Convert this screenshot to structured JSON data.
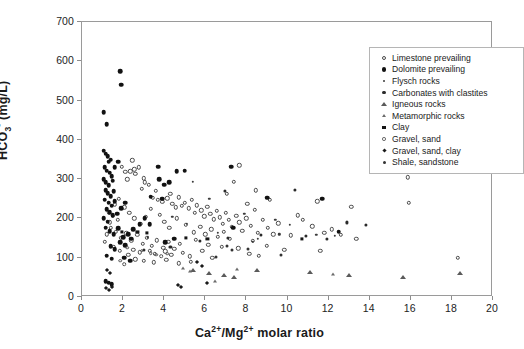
{
  "chart_data": {
    "type": "scatter",
    "title": "",
    "xlabel": "Ca2+/Mg2+ molar ratio",
    "ylabel": "HCO3- (mg/L)",
    "xlim": [
      0,
      20
    ],
    "ylim": [
      0,
      700
    ],
    "xticks": [
      "0",
      "2",
      "4",
      "6",
      "8",
      "10",
      "12",
      "14",
      "16",
      "18",
      "20"
    ],
    "yticks": [
      "0",
      "100",
      "200",
      "300",
      "400",
      "500",
      "600",
      "700"
    ],
    "grid": false,
    "legend_position": "top-right",
    "series": [
      {
        "name": "Limestone prevailing",
        "marker": "open-circle",
        "color": "#4a4a4a",
        "points": [
          [
            1.95,
            332
          ],
          [
            2.1,
            318
          ],
          [
            2.35,
            320
          ],
          [
            2.55,
            325
          ],
          [
            2.6,
            313
          ],
          [
            2.75,
            330
          ],
          [
            3.0,
            302
          ],
          [
            3.05,
            292
          ],
          [
            2.9,
            276
          ],
          [
            3.25,
            285
          ],
          [
            3.45,
            253
          ],
          [
            3.7,
            247
          ],
          [
            3.6,
            270
          ],
          [
            3.9,
            243
          ],
          [
            4.15,
            251
          ],
          [
            4.3,
            262
          ],
          [
            4.4,
            238
          ],
          [
            4.55,
            228
          ],
          [
            4.7,
            254
          ],
          [
            4.85,
            232
          ],
          [
            5.0,
            240
          ],
          [
            5.2,
            226
          ],
          [
            5.35,
            248
          ],
          [
            5.5,
            215
          ],
          [
            5.6,
            233
          ],
          [
            5.8,
            221
          ],
          [
            5.95,
            205
          ],
          [
            6.1,
            229
          ],
          [
            6.25,
            211
          ],
          [
            6.4,
            198
          ],
          [
            6.55,
            219
          ],
          [
            6.7,
            203
          ],
          [
            6.85,
            186
          ],
          [
            7.0,
            214
          ],
          [
            7.15,
            196
          ],
          [
            7.3,
            178
          ],
          [
            7.5,
            206
          ],
          [
            7.65,
            190
          ],
          [
            7.8,
            168
          ],
          [
            8.0,
            200
          ],
          [
            8.2,
            182
          ],
          [
            8.4,
            222
          ],
          [
            8.55,
            164
          ],
          [
            8.8,
            196
          ],
          [
            9.05,
            176
          ],
          [
            9.3,
            160
          ],
          [
            9.55,
            188
          ],
          [
            7.05,
            262
          ],
          [
            7.4,
            293
          ],
          [
            8.05,
            238
          ],
          [
            2.45,
            348
          ],
          [
            2.2,
            300
          ],
          [
            3.35,
            224
          ],
          [
            3.8,
            210
          ],
          [
            4.0,
            192
          ],
          [
            4.25,
            176
          ],
          [
            4.6,
            200
          ],
          [
            5.05,
            183
          ],
          [
            5.45,
            165
          ],
          [
            5.75,
            178
          ],
          [
            6.0,
            160
          ],
          [
            6.3,
            172
          ],
          [
            6.6,
            154
          ],
          [
            6.9,
            166
          ],
          [
            7.2,
            148
          ],
          [
            1.4,
            176
          ],
          [
            1.65,
            166
          ],
          [
            1.9,
            150
          ],
          [
            2.15,
            162
          ],
          [
            2.4,
            144
          ],
          [
            2.7,
            158
          ],
          [
            2.95,
            136
          ],
          [
            3.15,
            150
          ],
          [
            3.4,
            130
          ],
          [
            3.65,
            144
          ],
          [
            3.95,
            126
          ],
          [
            4.2,
            140
          ],
          [
            4.5,
            122
          ],
          [
            4.75,
            136
          ],
          [
            2.05,
            228
          ],
          [
            2.3,
            214
          ],
          [
            2.55,
            200
          ],
          [
            2.85,
            186
          ],
          [
            3.1,
            204
          ],
          [
            2.5,
            120
          ],
          [
            2.8,
            114
          ],
          [
            3.3,
            118
          ],
          [
            3.55,
            110
          ],
          [
            4.05,
            116
          ],
          [
            4.35,
            108
          ],
          [
            4.9,
            112
          ],
          [
            5.25,
            104
          ],
          [
            1.75,
            196
          ],
          [
            1.5,
            206
          ],
          [
            1.3,
            216
          ],
          [
            3.0,
            92
          ],
          [
            3.5,
            88
          ],
          [
            4.1,
            94
          ],
          [
            4.7,
            86
          ],
          [
            5.3,
            90
          ],
          [
            5.55,
            146
          ],
          [
            6.15,
            133
          ],
          [
            6.8,
            128
          ],
          [
            7.6,
            124
          ],
          [
            8.3,
            143
          ],
          [
            9.0,
            130
          ],
          [
            10.5,
            208
          ],
          [
            10.75,
            197
          ],
          [
            11.2,
            180
          ],
          [
            11.45,
            244
          ],
          [
            11.8,
            164
          ],
          [
            12.15,
            172
          ],
          [
            12.6,
            158
          ],
          [
            13.1,
            230
          ],
          [
            13.35,
            148
          ],
          [
            15.85,
            305
          ],
          [
            15.9,
            240
          ],
          [
            7.65,
            335
          ],
          [
            8.45,
            272
          ],
          [
            9.15,
            248
          ],
          [
            8.15,
            110
          ],
          [
            8.6,
            105
          ],
          [
            18.3,
            100
          ],
          [
            5.85,
            118
          ],
          [
            6.35,
            100
          ],
          [
            1.2,
            160
          ],
          [
            1.1,
            140
          ],
          [
            1.55,
            128
          ],
          [
            1.85,
            118
          ],
          [
            2.25,
            108
          ],
          [
            2.6,
            96
          ],
          [
            1.35,
            190
          ],
          [
            1.6,
            236
          ],
          [
            1.8,
            250
          ],
          [
            10.15,
            157
          ],
          [
            11.6,
            118
          ],
          [
            9.85,
            120
          ]
        ]
      },
      {
        "name": "Dolomite prevailing",
        "marker": "filled-circle",
        "color": "#121212",
        "points": [
          [
            1.05,
            470
          ],
          [
            1.2,
            440
          ],
          [
            1.85,
            575
          ],
          [
            1.9,
            540
          ],
          [
            1.05,
            372
          ],
          [
            1.15,
            365
          ],
          [
            1.25,
            358
          ],
          [
            1.3,
            344
          ],
          [
            1.4,
            350
          ],
          [
            1.1,
            330
          ],
          [
            1.2,
            322
          ],
          [
            1.35,
            316
          ],
          [
            1.45,
            308
          ],
          [
            1.05,
            300
          ],
          [
            1.15,
            292
          ],
          [
            1.3,
            285
          ],
          [
            1.5,
            296
          ],
          [
            1.6,
            330
          ],
          [
            1.75,
            344
          ],
          [
            1.15,
            272
          ],
          [
            1.25,
            264
          ],
          [
            1.4,
            256
          ],
          [
            1.55,
            270
          ],
          [
            1.1,
            248
          ],
          [
            1.3,
            240
          ],
          [
            1.45,
            232
          ],
          [
            1.6,
            244
          ],
          [
            1.2,
            224
          ],
          [
            1.35,
            216
          ],
          [
            1.5,
            208
          ],
          [
            1.05,
            200
          ],
          [
            1.25,
            192
          ],
          [
            1.7,
            212
          ],
          [
            1.9,
            226
          ],
          [
            2.1,
            240
          ],
          [
            1.15,
            176
          ],
          [
            1.35,
            168
          ],
          [
            1.55,
            160
          ],
          [
            1.75,
            175
          ],
          [
            2.0,
            152
          ],
          [
            2.25,
            160
          ],
          [
            2.5,
            172
          ],
          [
            2.8,
            186
          ],
          [
            3.05,
            200
          ],
          [
            3.3,
            186
          ],
          [
            1.4,
            130
          ],
          [
            1.6,
            122
          ],
          [
            1.85,
            140
          ],
          [
            2.1,
            132
          ],
          [
            2.4,
            148
          ],
          [
            1.2,
            105
          ],
          [
            1.45,
            98
          ],
          [
            1.15,
            40
          ],
          [
            1.3,
            36
          ],
          [
            1.45,
            32
          ],
          [
            3.7,
            332
          ],
          [
            3.75,
            300
          ],
          [
            4.0,
            286
          ],
          [
            4.25,
            292
          ],
          [
            3.35,
            255
          ],
          [
            3.9,
            250
          ],
          [
            4.6,
            320
          ],
          [
            5.0,
            322
          ],
          [
            9.0,
            253
          ],
          [
            11.7,
            250
          ],
          [
            7.25,
            332
          ],
          [
            12.5,
            166
          ],
          [
            7.35,
            176
          ],
          [
            4.05,
            140
          ],
          [
            4.5,
            148
          ],
          [
            2.05,
            100
          ],
          [
            2.35,
            92
          ]
        ]
      },
      {
        "name": "Flysch rocks",
        "marker": "tiny-dot",
        "color": "#3b3b3b",
        "points": [
          [
            5.4,
            293
          ],
          [
            6.2,
            250
          ],
          [
            7.9,
            212
          ],
          [
            9.4,
            196
          ],
          [
            10.1,
            183
          ],
          [
            11.4,
            158
          ],
          [
            12.3,
            155
          ],
          [
            9.6,
            160
          ],
          [
            4.4,
            204
          ],
          [
            5.1,
            186
          ],
          [
            6.6,
            164
          ],
          [
            3.2,
            152
          ],
          [
            8.3,
            140
          ],
          [
            8.55,
            148
          ]
        ]
      },
      {
        "name": "Carbonates with clastites",
        "marker": "small-dot",
        "color": "#2a2a2a",
        "points": [
          [
            6.95,
            270
          ],
          [
            10.35,
            272
          ],
          [
            12.9,
            190
          ],
          [
            13.8,
            183
          ],
          [
            8.7,
            158
          ],
          [
            7.1,
            150
          ],
          [
            5.75,
            143
          ],
          [
            4.3,
            128
          ],
          [
            3.0,
            120
          ],
          [
            10.9,
            155
          ],
          [
            11.9,
            148
          ]
        ]
      },
      {
        "name": "Igneous rocks",
        "marker": "open-tri",
        "color": "#5a5a5a",
        "points": [
          [
            6.2,
            62
          ],
          [
            6.9,
            56
          ],
          [
            7.4,
            52
          ],
          [
            8.5,
            68
          ],
          [
            13.0,
            55
          ],
          [
            15.6,
            50
          ],
          [
            18.4,
            62
          ],
          [
            11.1,
            64
          ],
          [
            5.4,
            70
          ]
        ]
      },
      {
        "name": "Metamorphic rocks",
        "marker": "small-tri",
        "color": "#6b6b6b",
        "points": [
          [
            4.9,
            75
          ],
          [
            5.25,
            66
          ],
          [
            6.45,
            42
          ],
          [
            7.55,
            72
          ],
          [
            12.2,
            58
          ]
        ]
      },
      {
        "name": "Clay",
        "marker": "square",
        "color": "#151515",
        "points": [
          [
            2.7,
            166
          ],
          [
            3.15,
            163
          ],
          [
            1.95,
            166
          ],
          [
            6.1,
            148
          ],
          [
            5.05,
            150
          ],
          [
            10.7,
            148
          ]
        ]
      },
      {
        "name": "Gravel, sand",
        "marker": "open-circle-sm",
        "color": "#555555",
        "points": [
          [
            2.9,
            118
          ],
          [
            3.35,
            112
          ],
          [
            3.6,
            108
          ],
          [
            2.2,
            125
          ],
          [
            3.85,
            104
          ],
          [
            4.15,
            110
          ],
          [
            1.85,
            92
          ],
          [
            2.05,
            84
          ]
        ]
      },
      {
        "name": "Gravel, sand, clay",
        "marker": "diamond",
        "color": "#1a1a1a",
        "points": [
          [
            1.2,
            68
          ],
          [
            1.35,
            60
          ],
          [
            1.15,
            22
          ],
          [
            1.3,
            18
          ],
          [
            1.45,
            25
          ],
          [
            4.65,
            30
          ],
          [
            4.8,
            26
          ],
          [
            6.1,
            36
          ],
          [
            5.6,
            88
          ],
          [
            5.85,
            80
          ]
        ]
      },
      {
        "name": "Shale, sandstone",
        "marker": "plus-dot",
        "color": "#333333",
        "points": [
          [
            7.05,
            130
          ],
          [
            7.3,
            120
          ],
          [
            9.7,
            108
          ],
          [
            8.1,
            122
          ],
          [
            6.5,
            102
          ]
        ]
      }
    ]
  },
  "axes": {
    "y_title_parts": {
      "pre": "HCO",
      "sub": "3",
      "sup": "-",
      "post": " (mg/L)"
    },
    "x_title_parts": {
      "ca": "Ca",
      "ca_sup": "2+",
      "slash": "/",
      "mg": "Mg",
      "mg_sup": "2+",
      "post": " molar ratio"
    }
  }
}
